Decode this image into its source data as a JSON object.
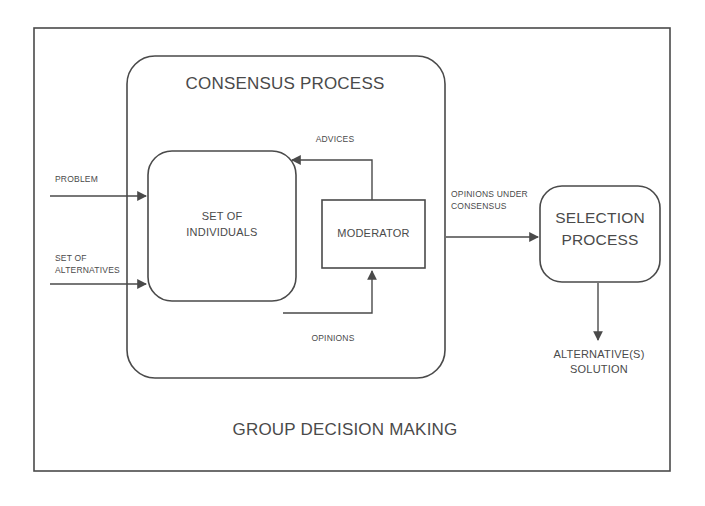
{
  "diagram": {
    "title": "GROUP DECISION MAKING",
    "outer_frame_label": "GROUP DECISION MAKING",
    "stroke_color": "#4a4a4a",
    "background_color": "#ffffff",
    "containers": [
      {
        "id": "group-decision-making",
        "label": "GROUP DECISION MAKING",
        "shape": "rectangle"
      },
      {
        "id": "consensus-process",
        "label": "CONSENSUS PROCESS",
        "shape": "rounded-rectangle"
      }
    ],
    "nodes": [
      {
        "id": "set-of-individuals",
        "label": "SET OF\nINDIVIDUALS",
        "line1": "SET OF",
        "line2": "INDIVIDUALS",
        "shape": "rounded-rectangle"
      },
      {
        "id": "moderator",
        "label": "MODERATOR",
        "line1": "MODERATOR",
        "shape": "rectangle"
      },
      {
        "id": "selection-process",
        "label": "SELECTION\nPROCESS",
        "line1": "SELECTION",
        "line2": "PROCESS",
        "shape": "rounded-rectangle"
      }
    ],
    "edge_labels": {
      "problem": "PROBLEM",
      "set_of_alternatives_line1": "SET OF",
      "set_of_alternatives_line2": "ALTERNATIVES",
      "advices": "ADVICES",
      "opinions": "OPINIONS",
      "opinions_under_consensus_line1": "OPINIONS UNDER",
      "opinions_under_consensus_line2": "CONSENSUS",
      "alternatives_solution_line1": "ALTERNATIVE(S)",
      "alternatives_solution_line2": "SOLUTION"
    },
    "headings": {
      "consensus_process": "CONSENSUS PROCESS",
      "group_decision_making": "GROUP DECISION MAKING"
    }
  }
}
